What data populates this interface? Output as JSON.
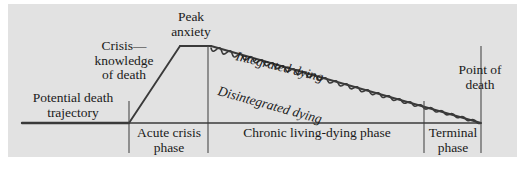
{
  "figure": {
    "background_color": "#ffffff",
    "panel_color": "#e2e2e2",
    "line_color": "#3a3a3a"
  },
  "labels": {
    "peak_anxiety": "Peak\nanxiety",
    "peak_anxiety_line1": "Peak",
    "peak_anxiety_line2": "anxiety",
    "crisis_line1": "Crisis—",
    "crisis_line2": "knowledge",
    "crisis_line3": "of death",
    "potential_line1": "Potential death",
    "potential_line2": "trajectory",
    "point_of_death_line1": "Point of",
    "point_of_death_line2": "death",
    "integrated_dying": "Integrated dying",
    "disintegrated_dying": "Disintegrated dying"
  },
  "phases": {
    "acute_line1": "Acute crisis",
    "acute_line2": "phase",
    "chronic": "Chronic  living-dying phase",
    "terminal_line1": "Terminal",
    "terminal_line2": "phase"
  },
  "chart_data": {
    "type": "line",
    "xlabel": "",
    "ylabel": "Anxiety level",
    "axis_baseline_y": 123,
    "phase_boundaries_x": [
      129,
      208,
      424,
      481
    ],
    "baseline_start_x": 22,
    "baseline_end_x": 481,
    "series": [
      {
        "name": "Potential death trajectory",
        "style": "straight",
        "points": [
          [
            22,
            123
          ],
          [
            129,
            123
          ]
        ]
      },
      {
        "name": "Rise to peak anxiety",
        "style": "straight",
        "points": [
          [
            129,
            123
          ],
          [
            180,
            46
          ]
        ]
      },
      {
        "name": "Peak anxiety plateau",
        "style": "straight",
        "points": [
          [
            180,
            46
          ],
          [
            211,
            46
          ]
        ]
      },
      {
        "name": "Integrated dying",
        "style": "straight",
        "points": [
          [
            211,
            46
          ],
          [
            481,
            123
          ]
        ]
      },
      {
        "name": "Disintegrated dying",
        "style": "wavy",
        "points": [
          [
            211,
            48
          ],
          [
            481,
            123
          ]
        ],
        "wave_amplitude": 2.6,
        "wave_period": 11
      }
    ]
  }
}
